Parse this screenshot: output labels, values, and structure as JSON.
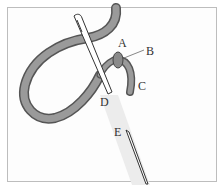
{
  "figure": {
    "labels": {
      "a": "A",
      "b": "B",
      "c": "C",
      "d": "D",
      "e": "E"
    },
    "colors": {
      "thread": "#8a8a8a",
      "thread_dark": "#555555",
      "needle": "#ffffff",
      "outline": "#333333",
      "frame": "#bdbdbd"
    }
  }
}
